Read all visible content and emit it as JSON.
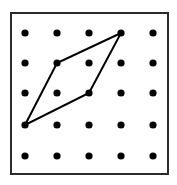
{
  "figure": {
    "canvas": {
      "width": 177,
      "height": 185,
      "background": "#ffffff"
    },
    "frame": {
      "name": "geoboard-frame",
      "x": 11,
      "y": 13,
      "width": 157,
      "height": 161,
      "stroke": "#2b2b2b",
      "stroke_width": 2,
      "fill": "#ffffff"
    },
    "grid": {
      "rows": 5,
      "cols": 5,
      "dot_radius": 3.6,
      "dot_color": "#000000",
      "col_x": [
        25,
        57,
        89,
        121,
        153
      ],
      "row_y": [
        33,
        63,
        93,
        125,
        156
      ],
      "points": [
        {
          "col": 1,
          "row": 1,
          "x": 25,
          "y": 33
        },
        {
          "col": 2,
          "row": 1,
          "x": 57,
          "y": 33
        },
        {
          "col": 3,
          "row": 1,
          "x": 89,
          "y": 33
        },
        {
          "col": 4,
          "row": 1,
          "x": 121,
          "y": 33
        },
        {
          "col": 5,
          "row": 1,
          "x": 153,
          "y": 33
        },
        {
          "col": 1,
          "row": 2,
          "x": 25,
          "y": 63
        },
        {
          "col": 2,
          "row": 2,
          "x": 57,
          "y": 63
        },
        {
          "col": 3,
          "row": 2,
          "x": 89,
          "y": 63
        },
        {
          "col": 4,
          "row": 2,
          "x": 121,
          "y": 63
        },
        {
          "col": 5,
          "row": 2,
          "x": 153,
          "y": 63
        },
        {
          "col": 1,
          "row": 3,
          "x": 25,
          "y": 93
        },
        {
          "col": 2,
          "row": 3,
          "x": 57,
          "y": 93
        },
        {
          "col": 3,
          "row": 3,
          "x": 89,
          "y": 93
        },
        {
          "col": 4,
          "row": 3,
          "x": 121,
          "y": 93
        },
        {
          "col": 5,
          "row": 3,
          "x": 153,
          "y": 93
        },
        {
          "col": 1,
          "row": 4,
          "x": 25,
          "y": 125
        },
        {
          "col": 2,
          "row": 4,
          "x": 57,
          "y": 125
        },
        {
          "col": 3,
          "row": 4,
          "x": 89,
          "y": 125
        },
        {
          "col": 4,
          "row": 4,
          "x": 121,
          "y": 125
        },
        {
          "col": 5,
          "row": 4,
          "x": 153,
          "y": 125
        },
        {
          "col": 1,
          "row": 5,
          "x": 25,
          "y": 156
        },
        {
          "col": 2,
          "row": 5,
          "x": 57,
          "y": 156
        },
        {
          "col": 3,
          "row": 5,
          "x": 89,
          "y": 156
        },
        {
          "col": 4,
          "row": 5,
          "x": 121,
          "y": 156
        },
        {
          "col": 5,
          "row": 5,
          "x": 153,
          "y": 156
        }
      ]
    },
    "polygon": {
      "name": "parallelogram",
      "stroke": "#000000",
      "stroke_width": 2,
      "fill": "none",
      "vertices": [
        {
          "label": "bottom-left",
          "col": 1,
          "row": 4,
          "x": 25,
          "y": 125
        },
        {
          "label": "left",
          "col": 2,
          "row": 2,
          "x": 57,
          "y": 63
        },
        {
          "label": "top-right",
          "col": 4,
          "row": 1,
          "x": 121,
          "y": 33
        },
        {
          "label": "right",
          "col": 3,
          "row": 3,
          "x": 89,
          "y": 93
        }
      ],
      "points_attr": "25,125 57,63 121,33 89,93"
    }
  }
}
